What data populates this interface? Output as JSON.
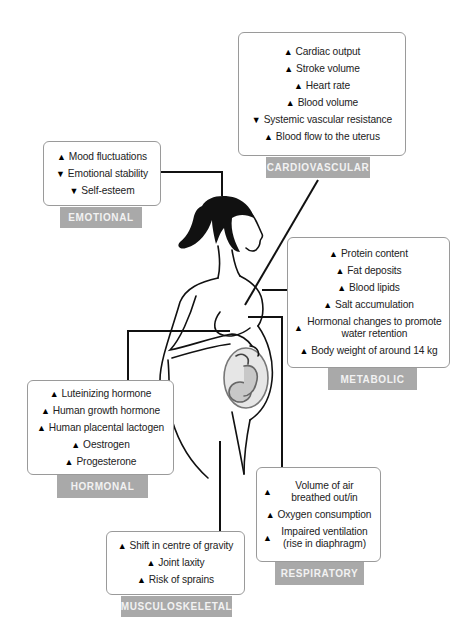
{
  "categories": {
    "cardiovascular": {
      "label": "CARDIOVASCULAR",
      "items": [
        {
          "direction": "up",
          "icon": "arrow-up-icon",
          "text": "Cardiac output"
        },
        {
          "direction": "up",
          "icon": "arrow-up-icon",
          "text": "Stroke volume"
        },
        {
          "direction": "up",
          "icon": "arrow-up-icon",
          "text": "Heart rate"
        },
        {
          "direction": "up",
          "icon": "arrow-up-icon",
          "text": "Blood volume"
        },
        {
          "direction": "down",
          "icon": "arrow-down-icon",
          "text": "Systemic vascular resistance"
        },
        {
          "direction": "up",
          "icon": "arrow-up-icon",
          "text": "Blood flow to the uterus"
        }
      ]
    },
    "emotional": {
      "label": "EMOTIONAL",
      "items": [
        {
          "direction": "up",
          "icon": "arrow-up-icon",
          "text": "Mood fluctuations"
        },
        {
          "direction": "down",
          "icon": "arrow-down-icon",
          "text": "Emotional stability"
        },
        {
          "direction": "down",
          "icon": "arrow-down-icon",
          "text": "Self-esteem"
        }
      ]
    },
    "metabolic": {
      "label": "METABOLIC",
      "items": [
        {
          "direction": "up",
          "icon": "arrow-up-icon",
          "text": "Protein content"
        },
        {
          "direction": "up",
          "icon": "arrow-up-icon",
          "text": "Fat deposits"
        },
        {
          "direction": "up",
          "icon": "arrow-up-icon",
          "text": "Blood lipids"
        },
        {
          "direction": "up",
          "icon": "arrow-up-icon",
          "text": "Salt accumulation"
        },
        {
          "direction": "up",
          "icon": "arrow-up-icon",
          "text": "Hormonal changes to promote water retention"
        },
        {
          "direction": "up",
          "icon": "arrow-up-icon",
          "text": "Body weight of around 14 kg"
        }
      ]
    },
    "hormonal": {
      "label": "HORMONAL",
      "items": [
        {
          "direction": "up",
          "icon": "arrow-up-icon",
          "text": "Luteinizing hormone"
        },
        {
          "direction": "up",
          "icon": "arrow-up-icon",
          "text": "Human growth hormone"
        },
        {
          "direction": "up",
          "icon": "arrow-up-icon",
          "text": "Human placental lactogen"
        },
        {
          "direction": "up",
          "icon": "arrow-up-icon",
          "text": "Oestrogen"
        },
        {
          "direction": "up",
          "icon": "arrow-up-icon",
          "text": "Progesterone"
        }
      ]
    },
    "respiratory": {
      "label": "RESPIRATORY",
      "items": [
        {
          "direction": "up",
          "icon": "arrow-up-icon",
          "text": "Volume of air breathed out/in"
        },
        {
          "direction": "up",
          "icon": "arrow-up-icon",
          "text": "Oxygen consumption"
        },
        {
          "direction": "up",
          "icon": "arrow-up-icon",
          "text": "Impaired ventilation (rise in diaphragm)"
        }
      ]
    },
    "musculoskeletal": {
      "label": "MUSCULOSKELETAL",
      "items": [
        {
          "direction": "up",
          "icon": "arrow-up-icon",
          "text": "Shift in centre of gravity"
        },
        {
          "direction": "up",
          "icon": "arrow-up-icon",
          "text": "Joint laxity"
        },
        {
          "direction": "up",
          "icon": "arrow-up-icon",
          "text": "Risk of sprains"
        }
      ]
    }
  },
  "glyphs": {
    "up": "🡅",
    "down": "🡇"
  },
  "colors": {
    "box_border": "#9a9a9a",
    "label_bg": "#a9a9a9",
    "label_text": "#f2f2f2",
    "line": "#111111",
    "fetus_fill": "#c8c8c8"
  }
}
